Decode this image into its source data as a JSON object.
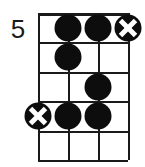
{
  "diagram": {
    "type": "guitar-chord-diagram",
    "position_label": "5",
    "strings": 4,
    "frets": 5,
    "colors": {
      "ink": "#1a1a1a",
      "marker_fill": "#0d0d0d",
      "cross_stroke": "#ffffff",
      "background": "#ffffff"
    },
    "string_x": [
      0,
      30,
      60,
      90
    ],
    "fret_y": [
      0,
      29.4,
      58.8,
      88.2,
      117.6,
      147
    ],
    "markers": [
      {
        "name": "marker-fret1-string2",
        "kind": "dot",
        "string": 2,
        "fret": 1
      },
      {
        "name": "marker-fret1-string3",
        "kind": "dot",
        "string": 3,
        "fret": 1
      },
      {
        "name": "marker-fret1-string4",
        "kind": "cross",
        "string": 4,
        "fret": 1
      },
      {
        "name": "marker-fret2-string2",
        "kind": "dot",
        "string": 2,
        "fret": 2
      },
      {
        "name": "marker-fret3-string3",
        "kind": "dot",
        "string": 3,
        "fret": 3
      },
      {
        "name": "marker-fret4-string1",
        "kind": "cross",
        "string": 1,
        "fret": 4
      },
      {
        "name": "marker-fret4-string2",
        "kind": "dot",
        "string": 2,
        "fret": 4
      },
      {
        "name": "marker-fret4-string3",
        "kind": "dot",
        "string": 3,
        "fret": 4
      }
    ]
  }
}
